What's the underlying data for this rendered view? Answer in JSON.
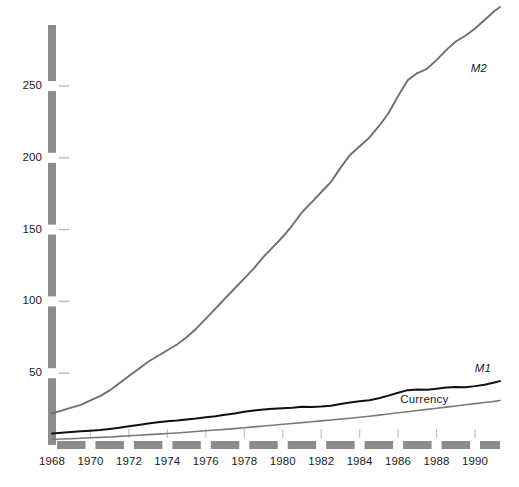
{
  "chart_data": {
    "type": "line",
    "title": "",
    "subtitle": "",
    "xlabel": "",
    "ylabel": "",
    "xlim": [
      1968,
      1991.3
    ],
    "ylim": [
      0,
      300
    ],
    "grid": false,
    "legend_position": "inline-right-of-line-ends",
    "y_ticks": [
      50,
      100,
      150,
      200,
      250
    ],
    "y_tick_labels": [
      "50",
      "100",
      "150",
      "200",
      "250"
    ],
    "x_ticks": [
      1968,
      1970,
      1972,
      1974,
      1976,
      1978,
      1980,
      1982,
      1984,
      1986,
      1988,
      1990
    ],
    "x_tick_labels": [
      "1968",
      "1970",
      "1972",
      "1974",
      "1976",
      "1978",
      "1980",
      "1982",
      "1984",
      "1986",
      "1988",
      "1990"
    ],
    "x": [
      1968.0,
      1968.5,
      1969.0,
      1969.5,
      1970.0,
      1970.5,
      1971.0,
      1971.5,
      1972.0,
      1972.5,
      1973.0,
      1973.5,
      1974.0,
      1974.5,
      1975.0,
      1975.5,
      1976.0,
      1976.5,
      1977.0,
      1977.5,
      1978.0,
      1978.5,
      1979.0,
      1979.5,
      1980.0,
      1980.5,
      1981.0,
      1981.5,
      1982.0,
      1982.5,
      1983.0,
      1983.5,
      1984.0,
      1984.5,
      1985.0,
      1985.5,
      1986.0,
      1986.5,
      1987.0,
      1987.5,
      1988.0,
      1988.5,
      1989.0,
      1989.5,
      1990.0,
      1990.5,
      1991.0,
      1991.3
    ],
    "series": [
      {
        "name": "M2",
        "color": "#6f6f6f",
        "width": 1.9,
        "label": "M2",
        "label_style": "italic",
        "values": [
          22,
          24,
          26,
          28,
          31,
          34,
          38,
          43,
          48,
          53,
          58,
          62,
          66,
          70,
          75,
          81,
          88,
          95,
          102,
          109,
          116,
          123,
          131,
          138,
          145,
          153,
          162,
          169,
          176,
          183,
          193,
          202,
          208,
          214,
          222,
          231,
          243,
          254,
          259,
          262,
          268,
          275,
          281,
          285,
          290,
          296,
          302,
          305
        ]
      },
      {
        "name": "M1",
        "color": "#111111",
        "width": 2.0,
        "label": "M1",
        "label_style": "italic",
        "values": [
          8,
          8.5,
          9,
          9.5,
          10,
          10.5,
          11.2,
          12,
          13,
          14,
          15,
          15.8,
          16.5,
          17,
          17.8,
          18.5,
          19.4,
          20,
          21,
          22,
          23.2,
          24,
          24.8,
          25.2,
          25.6,
          26,
          26.6,
          26.4,
          26.8,
          27.4,
          28.6,
          29.6,
          30.4,
          31.2,
          32.6,
          34.4,
          36.4,
          38.2,
          38.6,
          38.4,
          39.2,
          40,
          40.4,
          40.2,
          41,
          42,
          43.5,
          44.5
        ]
      },
      {
        "name": "Currency",
        "color": "#7a7a7a",
        "width": 1.6,
        "label": "Currency",
        "label_style": "regular",
        "values": [
          4,
          4.2,
          4.4,
          4.7,
          5,
          5.3,
          5.6,
          6,
          6.4,
          6.8,
          7.2,
          7.6,
          8,
          8.4,
          8.9,
          9.4,
          9.9,
          10.4,
          10.9,
          11.4,
          12,
          12.6,
          13.2,
          13.8,
          14.4,
          15,
          15.6,
          16.2,
          16.8,
          17.4,
          18,
          18.6,
          19.3,
          20,
          20.8,
          21.6,
          22.4,
          23.2,
          24,
          24.8,
          25.6,
          26.4,
          27.2,
          28,
          28.8,
          29.6,
          30.4,
          31
        ]
      }
    ],
    "annotations": [
      {
        "text": "M2",
        "x": 1990.2,
        "y": 262,
        "style": "italic"
      },
      {
        "text": "M1",
        "x": 1990.4,
        "y": 53,
        "style": "italic"
      },
      {
        "text": "Currency",
        "x": 1988.4,
        "y": 31,
        "style": "regular"
      }
    ]
  },
  "axes": {
    "axis_color": "#8c8c8c",
    "axis_bar_thickness_px": 8,
    "y_axis_style": "thick-segmented-bar",
    "x_axis_style": "thick-dashed-bar"
  },
  "colors": {
    "background": "#ffffff",
    "text": "#1c1c1c",
    "m2": "#6f6f6f",
    "m1": "#111111",
    "currency": "#7a7a7a",
    "axis": "#8c8c8c"
  }
}
